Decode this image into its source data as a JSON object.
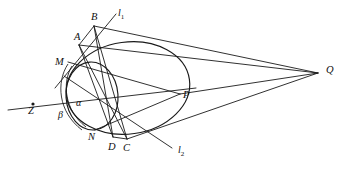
{
  "figure": {
    "kind": "geometry-diagram",
    "background_color": "#ffffff",
    "stroke_color": "#1a1a1a",
    "width": 343,
    "height": 176
  },
  "labels": {
    "B": "B",
    "A": "A",
    "M": "M",
    "Z": "Z",
    "alpha": "α",
    "beta": "β",
    "N": "N",
    "D": "D",
    "C": "C",
    "P": "P",
    "Q": "Q",
    "l1_base": "l",
    "l1_sub": "1",
    "l2_base": "l",
    "l2_sub": "2"
  },
  "points": {
    "B": {
      "x": 94,
      "y": 26
    },
    "A": {
      "x": 79,
      "y": 45
    },
    "M": {
      "x": 68,
      "y": 62
    },
    "Z": {
      "x": 33,
      "y": 104
    },
    "N": {
      "x": 95,
      "y": 130
    },
    "D": {
      "x": 113,
      "y": 137
    },
    "C": {
      "x": 127,
      "y": 139
    },
    "P": {
      "x": 180,
      "y": 94
    },
    "Q": {
      "x": 318,
      "y": 73
    }
  },
  "label_positions": {
    "B": {
      "x": 91,
      "y": 12
    },
    "A": {
      "x": 74,
      "y": 32
    },
    "M": {
      "x": 55,
      "y": 57
    },
    "Z": {
      "x": 28,
      "y": 106
    },
    "alpha": {
      "x": 76,
      "y": 98
    },
    "beta": {
      "x": 58,
      "y": 110
    },
    "N": {
      "x": 88,
      "y": 132
    },
    "D": {
      "x": 108,
      "y": 142
    },
    "C": {
      "x": 123,
      "y": 143
    },
    "P": {
      "x": 183,
      "y": 90
    },
    "Q": {
      "x": 326,
      "y": 65
    },
    "l1": {
      "x": 118,
      "y": 8
    },
    "l2": {
      "x": 178,
      "y": 145
    }
  },
  "curves": {
    "large_conic": {
      "name": "main-ellipse",
      "center": {
        "x": 128,
        "y": 88
      },
      "rx": 62,
      "ry": 46,
      "rotation_deg": -8
    },
    "small_conic": {
      "name": "inner-circle",
      "center": {
        "x": 92,
        "y": 96
      },
      "rx": 26,
      "ry": 34,
      "rotation_deg": -4
    }
  },
  "segments": [
    {
      "name": "line-l1",
      "from": "l1-far",
      "to": "l1-near"
    },
    {
      "name": "line-l2",
      "from": "l2-near",
      "to": "l2-far"
    },
    {
      "name": "chord-A-B",
      "from": "A",
      "to": "B"
    },
    {
      "name": "chord-B-D",
      "from": "B",
      "to": "D"
    },
    {
      "name": "chord-B-C",
      "from": "B",
      "to": "C"
    },
    {
      "name": "chord-A-D",
      "from": "A",
      "to": "D"
    },
    {
      "name": "chord-A-C",
      "from": "A",
      "to": "C"
    },
    {
      "name": "chord-D-C",
      "from": "D",
      "to": "C"
    },
    {
      "name": "ray-B-Q",
      "from": "B",
      "to": "Q"
    },
    {
      "name": "ray-A-Q",
      "from": "A",
      "to": "Q"
    },
    {
      "name": "ray-C-Q",
      "from": "C",
      "to": "Q"
    },
    {
      "name": "ray-P-Q",
      "from": "P",
      "to": "Q"
    },
    {
      "name": "polar-Z-P",
      "from": "Z",
      "to": "P"
    },
    {
      "name": "chord-M-P",
      "from": "M",
      "to": "P"
    },
    {
      "name": "chord-N-P",
      "from": "N",
      "to": "P"
    }
  ],
  "angles": [
    {
      "name": "angle-alpha",
      "label": "α",
      "vertex": "Z-M-N region"
    },
    {
      "name": "angle-beta",
      "label": "β",
      "vertex": "Z-M-N region"
    }
  ]
}
